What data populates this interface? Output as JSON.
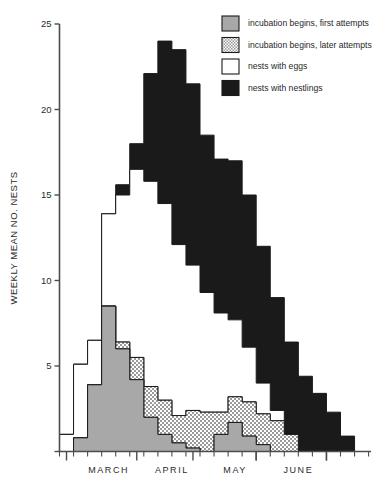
{
  "chart_data": {
    "type": "area",
    "subtype": "stacked-step-area",
    "title": "",
    "xlabel": "",
    "ylabel": "WEEKLY MEAN NO. NESTS",
    "ylim": [
      0,
      25
    ],
    "yticks": [
      0,
      5,
      10,
      15,
      20,
      25
    ],
    "ytick_labels": [
      "",
      "5",
      "10",
      "15",
      "20",
      "25"
    ],
    "grid": false,
    "legend_position": "top-right",
    "x_axis": {
      "type": "weeks",
      "month_labels": [
        "MARCH",
        "APRIL",
        "MAY",
        "JUNE"
      ],
      "month_label_positions": [
        3.5,
        8.0,
        12.5,
        17.0
      ],
      "n_weeks": 21,
      "week_index_start": 0,
      "major_tick_weeks": [
        0.5,
        5.5,
        9.5,
        14.0,
        19.0
      ],
      "minor_tick_every_week": true
    },
    "categories": [
      "w1",
      "w2",
      "w3",
      "w4",
      "w5",
      "w6",
      "w7",
      "w8",
      "w9",
      "w10",
      "w11",
      "w12",
      "w13",
      "w14",
      "w15",
      "w16",
      "w17",
      "w18",
      "w19",
      "w20",
      "w21"
    ],
    "series": [
      {
        "name": "incubation begins, first attempts",
        "fill": "solid-gray",
        "color": "#a8a8a8",
        "values": [
          0.0,
          0.8,
          3.9,
          8.5,
          6.0,
          4.2,
          2.0,
          1.0,
          0.5,
          0.2,
          0.0,
          1.0,
          1.7,
          0.9,
          0.4,
          0.0,
          0.0,
          0.0,
          0.0,
          0.0,
          0.0
        ]
      },
      {
        "name": "incubation begins, later attempts",
        "fill": "checker-gray",
        "color": "#c8c8c8",
        "values": [
          0.0,
          0.0,
          0.0,
          0.0,
          0.4,
          1.3,
          1.8,
          2.0,
          1.6,
          2.2,
          2.3,
          1.3,
          1.5,
          2.0,
          1.8,
          1.8,
          1.0,
          0.0,
          0.0,
          0.0,
          0.0
        ]
      },
      {
        "name": "nests with eggs",
        "fill": "white",
        "color": "#ffffff",
        "values": [
          1.0,
          4.3,
          2.6,
          5.4,
          8.6,
          11.0,
          12.0,
          11.5,
          10.0,
          8.5,
          7.0,
          5.8,
          4.5,
          3.2,
          1.8,
          0.6,
          0.0,
          0.0,
          0.0,
          0.0,
          0.0
        ]
      },
      {
        "name": "nests with nestlings",
        "fill": "black",
        "color": "#1a1a1a",
        "values": [
          0.0,
          0.0,
          0.0,
          0.0,
          0.6,
          1.5,
          6.3,
          9.5,
          11.4,
          10.6,
          9.2,
          9.0,
          9.3,
          8.9,
          8.0,
          6.6,
          5.4,
          4.4,
          3.4,
          2.3,
          0.9
        ]
      }
    ],
    "stack_tops": {
      "first_attempts": [
        0.0,
        0.8,
        3.9,
        8.5,
        6.0,
        4.2,
        2.0,
        1.0,
        0.5,
        0.2,
        0.0,
        1.0,
        1.7,
        0.9,
        0.4,
        0.0,
        0.0,
        0.0,
        0.0,
        0.0,
        0.0
      ],
      "later_attempts": [
        0.0,
        0.8,
        3.9,
        8.5,
        6.4,
        5.5,
        3.8,
        3.0,
        2.1,
        2.4,
        2.3,
        2.3,
        3.2,
        2.9,
        2.2,
        1.8,
        1.0,
        0.0,
        0.0,
        0.0,
        0.0
      ],
      "with_eggs": [
        1.0,
        5.1,
        6.5,
        13.9,
        15.0,
        16.5,
        15.8,
        14.5,
        12.1,
        10.9,
        9.3,
        8.1,
        7.7,
        6.1,
        4.0,
        2.4,
        1.0,
        0.0,
        0.0,
        0.0,
        0.0
      ],
      "with_nestlings": [
        1.0,
        5.1,
        6.5,
        13.9,
        15.6,
        18.0,
        22.1,
        24.0,
        23.5,
        21.5,
        18.5,
        17.1,
        17.0,
        15.0,
        12.0,
        9.0,
        6.4,
        4.4,
        3.4,
        2.3,
        0.9
      ]
    },
    "legend": [
      {
        "label": "incubation begins, first attempts",
        "swatch": "solid-gray"
      },
      {
        "label": "incubation begins, later attempts",
        "swatch": "checker-gray"
      },
      {
        "label": "nests with eggs",
        "swatch": "white"
      },
      {
        "label": "nests with nestlings",
        "swatch": "black"
      }
    ],
    "colors": {
      "first_attempts": "#a8a8a8",
      "later_attempts": "#c9c9c9",
      "eggs": "#ffffff",
      "nestlings": "#1a1a1a",
      "axis": "#4d4d4d",
      "outline": "#1a1a1a",
      "background": "#ffffff"
    }
  }
}
